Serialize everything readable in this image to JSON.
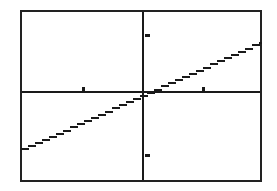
{
  "device": {
    "name": "graphing-calculator-screen",
    "screen_label": "Graphing calculator plot window",
    "background_color": "#ffffff",
    "ink_color": "#1a1a1a",
    "border_color": "#222222",
    "border_width_px": 2
  },
  "screen": {
    "left_px": 20,
    "top_px": 10,
    "width_px": 242,
    "height_px": 172
  },
  "chart_data": {
    "type": "line",
    "title": "",
    "subtitle": "",
    "xlabel": "",
    "ylabel": "",
    "grid": false,
    "legend": "none",
    "axes": {
      "x_axis_visible": true,
      "y_axis_visible": true,
      "x_axis_pixel_y": 92,
      "y_axis_pixel_x": 143,
      "origin_px": [
        143,
        92
      ]
    },
    "xlim": [
      -10,
      10
    ],
    "ylim": [
      -10,
      10
    ],
    "xticks": [
      -5,
      5
    ],
    "yticks": [
      -5,
      5
    ],
    "xtick_labels": [
      "",
      ""
    ],
    "ytick_labels": [
      "",
      ""
    ],
    "tick_pixel_x": [
      83,
      203
    ],
    "tick_pixel_y": [
      35,
      155
    ],
    "series": [
      {
        "name": "Y1",
        "style": "solid",
        "color": "#1a1a1a",
        "x": [
          -10,
          -7.5,
          -5,
          -2.5,
          0,
          2.5,
          5,
          7.5,
          10
        ],
        "y": [
          -4.9,
          -3.7,
          -2.4,
          -1.2,
          0,
          1.2,
          2.4,
          3.7,
          4.9
        ],
        "slope": 0.49,
        "intercept": 0,
        "pixel_start": [
          21,
          151
        ],
        "pixel_end": [
          261,
          43
        ]
      }
    ],
    "annotations": []
  }
}
